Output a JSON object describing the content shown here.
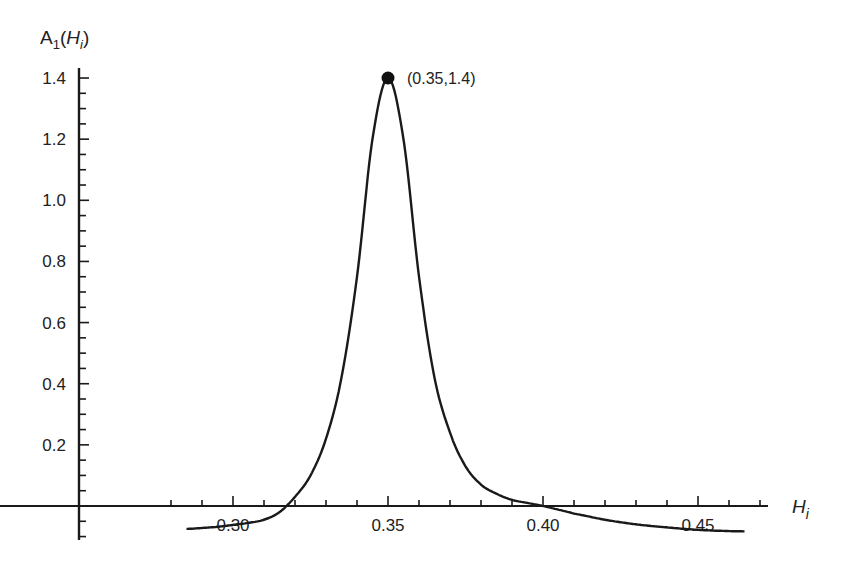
{
  "chart_data": {
    "type": "line",
    "title": "",
    "xlabel": "H_i",
    "ylabel": "A_1(H_i)",
    "xlabel_parts": {
      "base": "H",
      "sub": "i"
    },
    "ylabel_parts": {
      "prefix": "A",
      "prefix_sub": "1",
      "open": "(",
      "var": "H",
      "var_sub": "i",
      "close": ")"
    },
    "xlim": [
      0.285,
      0.475
    ],
    "ylim": [
      -0.09,
      1.45
    ],
    "x_ticks": [
      {
        "value": 0.3,
        "label": "0.30"
      },
      {
        "value": 0.35,
        "label": "0.35"
      },
      {
        "value": 0.4,
        "label": "0.40"
      },
      {
        "value": 0.45,
        "label": "0.45"
      }
    ],
    "y_ticks": [
      {
        "value": 0.2,
        "label": "0.2"
      },
      {
        "value": 0.4,
        "label": "0.4"
      },
      {
        "value": 0.6,
        "label": "0.6"
      },
      {
        "value": 0.8,
        "label": "0.8"
      },
      {
        "value": 1.0,
        "label": "1.0"
      },
      {
        "value": 1.2,
        "label": "1.2"
      },
      {
        "value": 1.4,
        "label": "1.4"
      }
    ],
    "grid": false,
    "legend": null,
    "series": [
      {
        "name": "A1(Hi)",
        "color": "#1a1a1a",
        "x": [
          0.285,
          0.29,
          0.295,
          0.3,
          0.305,
          0.31,
          0.315,
          0.32,
          0.325,
          0.33,
          0.335,
          0.34,
          0.345,
          0.35,
          0.355,
          0.36,
          0.365,
          0.37,
          0.375,
          0.38,
          0.385,
          0.39,
          0.395,
          0.4,
          0.405,
          0.41,
          0.42,
          0.43,
          0.44,
          0.45,
          0.46,
          0.465
        ],
        "y": [
          -0.075,
          -0.072,
          -0.068,
          -0.062,
          -0.055,
          -0.045,
          -0.02,
          0.03,
          0.1,
          0.22,
          0.42,
          0.75,
          1.2,
          1.4,
          1.2,
          0.75,
          0.42,
          0.24,
          0.13,
          0.07,
          0.04,
          0.02,
          0.01,
          0.0,
          -0.012,
          -0.025,
          -0.045,
          -0.06,
          -0.07,
          -0.078,
          -0.082,
          -0.083
        ]
      }
    ],
    "annotations": [
      {
        "type": "point",
        "x": 0.35,
        "y": 1.4,
        "label": "(0.35,1.4)"
      }
    ]
  }
}
